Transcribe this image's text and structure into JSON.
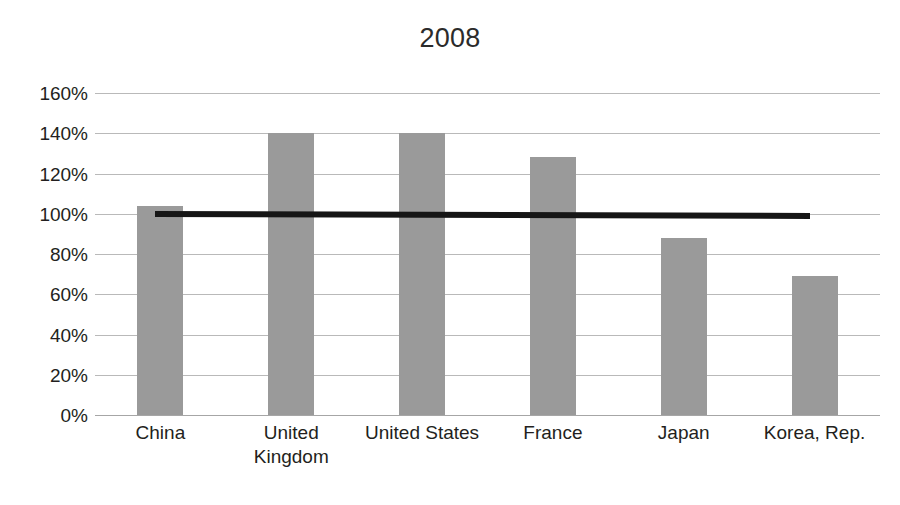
{
  "chart_data": {
    "type": "bar",
    "title": "2008",
    "xlabel": "",
    "ylabel": "",
    "categories": [
      "China",
      "United Kingdom",
      "United States",
      "France",
      "Japan",
      "Korea, Rep."
    ],
    "values": [
      104,
      140,
      140,
      128,
      88,
      69
    ],
    "value_labels": [
      "104%",
      "140%",
      "140%",
      "128%",
      "88%",
      "69%"
    ],
    "series": [
      {
        "name": "2008",
        "values": [
          104,
          140,
          140,
          128,
          88,
          69
        ]
      }
    ],
    "ylim": [
      0,
      160
    ],
    "ytick_values": [
      0,
      20,
      40,
      60,
      80,
      100,
      120,
      140,
      160
    ],
    "ytick_labels": [
      "0%",
      "20%",
      "40%",
      "60%",
      "80%",
      "100%",
      "120%",
      "140%",
      "160%"
    ],
    "grid": true,
    "legend": "none",
    "annotations": [
      {
        "name": "reference-line",
        "type": "horizontal-line",
        "value": 100,
        "label": "100%",
        "color": "#161616"
      }
    ],
    "colors": {
      "bar_fill": "#9a9a9a",
      "gridline": "#b9b9b9",
      "reference_line": "#161616",
      "text": "#231f20",
      "background": "#ffffff"
    }
  }
}
